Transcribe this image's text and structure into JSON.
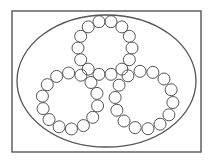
{
  "diagram": {
    "width": 212,
    "height": 164,
    "background": "#ffffff",
    "stroke_color": "#555555",
    "frame": {
      "x": 12,
      "y": 11,
      "width": 189,
      "height": 141,
      "stroke_width": 1.4
    },
    "ellipse": {
      "cx": 106.5,
      "cy": 81,
      "rx": 89.5,
      "ry": 66,
      "stroke_width": 1.3
    },
    "rings": [
      {
        "name": "top-ring",
        "cx": 105,
        "cy": 48,
        "r": 27,
        "bead_count": 14,
        "bead_radius": 6,
        "start_angle": 0
      },
      {
        "name": "left-ring",
        "cx": 70,
        "cy": 101,
        "r": 28,
        "bead_count": 14,
        "bead_radius": 6,
        "start_angle": 10
      },
      {
        "name": "right-ring",
        "cx": 144,
        "cy": 100,
        "r": 29,
        "bead_count": 14,
        "bead_radius": 6,
        "start_angle": 5
      }
    ],
    "bead_stroke_width": 1.0
  }
}
